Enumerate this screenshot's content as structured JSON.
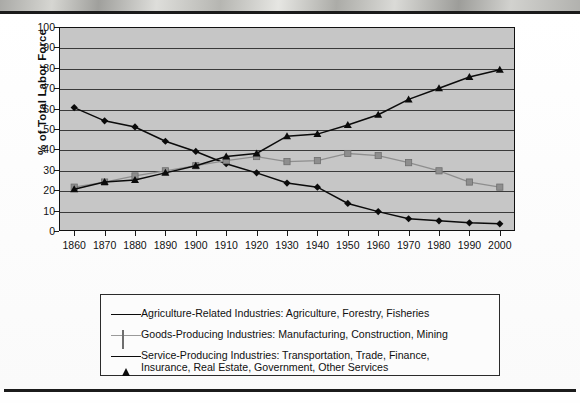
{
  "chart_data": {
    "type": "line",
    "title": "",
    "xlabel": "",
    "ylabel": "% of Total Labor Force",
    "ylim": [
      0,
      100
    ],
    "ytick_step": 10,
    "grid": true,
    "legend_position": "bottom",
    "categories": [
      "1860",
      "1870",
      "1880",
      "1890",
      "1900",
      "1910",
      "1920",
      "1930",
      "1940",
      "1950",
      "1960",
      "1970",
      "1980",
      "1990",
      "2000"
    ],
    "yticks": [
      "0",
      "10",
      "20",
      "30",
      "40",
      "50",
      "60",
      "70",
      "80",
      "90",
      "100"
    ],
    "series": [
      {
        "name": "Agriculture-Related Industries: Agriculture, Forestry, Fisheries",
        "marker": "diamond",
        "color": "#0b0b0b",
        "values": [
          60.5,
          54,
          51,
          44,
          39,
          33,
          28.5,
          23.5,
          21.5,
          13.5,
          9.5,
          6,
          5,
          4,
          3.5
        ]
      },
      {
        "name": "Goods-Producing Industries: Manufacturing, Construction, Mining",
        "marker": "square",
        "color": "#8e8e8e",
        "values": [
          21.5,
          24,
          27,
          29.5,
          32,
          34.5,
          36.5,
          34,
          34.5,
          38,
          37,
          33.5,
          29.5,
          24,
          21.5
        ]
      },
      {
        "name": "Service-Producing Industries: Transportation, Trade, Finance,\nInsurance, Real Estate, Government, Other Services",
        "marker": "triangle",
        "color": "#0b0b0b",
        "values": [
          20.5,
          24,
          25,
          28.5,
          32,
          36.5,
          38,
          46.5,
          47.5,
          52,
          57,
          64.5,
          70,
          75.5,
          79
        ]
      }
    ]
  },
  "colors": {
    "plot_background": "#c6c6c6",
    "gridline": "#3a3a3a",
    "axis": "#111111",
    "series_dark": "#0b0b0b",
    "series_gray": "#8e8e8e",
    "rule": "#1b1b1b"
  }
}
